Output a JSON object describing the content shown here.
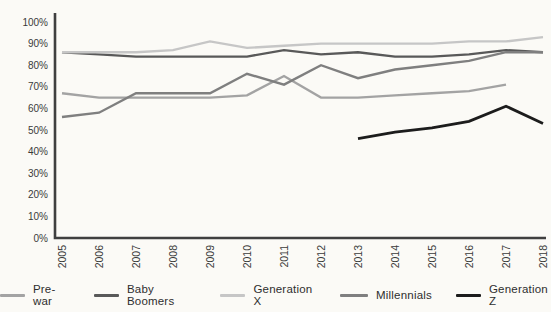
{
  "chart_data": {
    "type": "line",
    "x": [
      2005,
      2006,
      2007,
      2008,
      2009,
      2010,
      2011,
      2012,
      2013,
      2014,
      2015,
      2016,
      2017,
      2018
    ],
    "series": [
      {
        "name": "Pre-war",
        "color": "#a3a3a3",
        "values": [
          67,
          65,
          65,
          65,
          65,
          66,
          75,
          65,
          65,
          66,
          67,
          68,
          71,
          null
        ]
      },
      {
        "name": "Baby Boomers",
        "color": "#595959",
        "values": [
          86,
          85,
          84,
          84,
          84,
          84,
          87,
          85,
          86,
          84,
          84,
          85,
          87,
          86
        ]
      },
      {
        "name": "Generation X",
        "color": "#c6c6c6",
        "values": [
          86,
          86,
          86,
          87,
          91,
          88,
          89,
          90,
          90,
          90,
          90,
          91,
          91,
          93
        ]
      },
      {
        "name": "Millennials",
        "color": "#7f7f7f",
        "values": [
          56,
          58,
          67,
          67,
          67,
          76,
          71,
          80,
          74,
          78,
          80,
          82,
          86,
          86
        ]
      },
      {
        "name": "Generation Z",
        "color": "#1c1c1c",
        "values": [
          null,
          null,
          null,
          null,
          null,
          null,
          null,
          null,
          46,
          49,
          51,
          54,
          61,
          53
        ]
      }
    ],
    "title": "",
    "xlabel": "",
    "ylabel": "",
    "ylim": [
      0,
      100
    ],
    "grid": false,
    "legend_position": "bottom"
  },
  "axis": {
    "y_ticks": [
      "0%",
      "10%",
      "20%",
      "30%",
      "40%",
      "50%",
      "60%",
      "70%",
      "80%",
      "90%",
      "100%"
    ],
    "x_ticks": [
      "2005",
      "2006",
      "2007",
      "2008",
      "2009",
      "2010",
      "2011",
      "2012",
      "2013",
      "2014",
      "2015",
      "2016",
      "2017",
      "2018"
    ],
    "tick_color": "#3a3a3a",
    "axis_color": "#3f3f3f"
  }
}
